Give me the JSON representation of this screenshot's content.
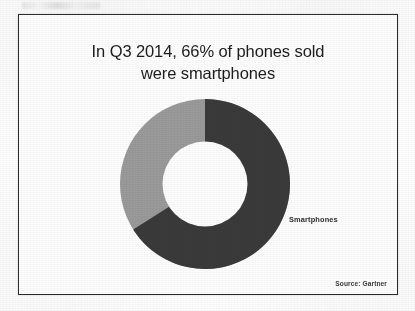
{
  "slide": {
    "title": "In Q3 2014, 66% of phones sold\nwere smartphones",
    "source_note": "Source: Gartner",
    "frame_color": "#2c2c2c",
    "background_color": "#fdfdfd"
  },
  "chart_data": {
    "type": "pie",
    "variant": "donut",
    "title": "In Q3 2014, 66% of phones sold were smartphones",
    "categories": [
      "Smartphones",
      "Other phones"
    ],
    "values": [
      66,
      34
    ],
    "unit": "%",
    "colors": [
      "#3a3a3a",
      "#9a9a9a"
    ],
    "labels": [
      {
        "text": "Smartphones",
        "category": "Smartphones",
        "value": 66
      }
    ],
    "start_angle_deg": 0,
    "direction": "clockwise",
    "inner_radius_ratio": 0.5,
    "legend": "none",
    "grid": false,
    "annotations": [
      "Source: Gartner"
    ]
  },
  "geometry": {
    "center_x": 204,
    "center_y": 183,
    "outer_radius": 85,
    "inner_radius": 43
  }
}
